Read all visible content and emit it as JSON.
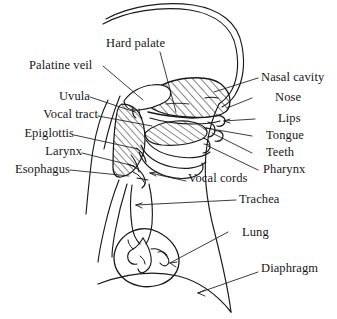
{
  "figure": {
    "ink_color": "#1a1a1a",
    "background_color": "#ffffff",
    "hatch_color": "#1a1a1a"
  },
  "labels": {
    "hard_palate": "Hard palate",
    "palatine_veil": "Palatine veil",
    "uvula": "Uvula",
    "vocal_tract": "Vocal tract",
    "epiglottis": "Epiglottis",
    "larynx": "Larynx",
    "esophagus": "Esophagus",
    "nasal_cavity": "Nasal cavity",
    "nose": "Nose",
    "lips": "Lips",
    "tongue": "Tongue",
    "teeth": "Teeth",
    "pharynx": "Pharynx",
    "vocal_cords": "Vocal cords",
    "trachea": "Trachea",
    "lung": "Lung",
    "diaphragm": "Diaphragm"
  }
}
